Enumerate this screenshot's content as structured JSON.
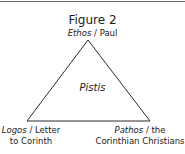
{
  "figure": {
    "title": "Figure 2",
    "center": "Pistis",
    "apex": {
      "term": "Ethos",
      "separator": " / ",
      "referent": "Paul"
    },
    "bottom_left": {
      "term": "Logos",
      "separator": " / ",
      "referent_line1": "Letter",
      "line2": "to Corinth"
    },
    "bottom_right": {
      "term": "Pathos",
      "separator": " / ",
      "referent_line1": "the",
      "line2": "Corinthian Christians"
    }
  },
  "colors": {
    "line": "#2a2a2a",
    "rule": "#6a6a6a",
    "text": "#1a1a1a",
    "background": "#ffffff"
  }
}
